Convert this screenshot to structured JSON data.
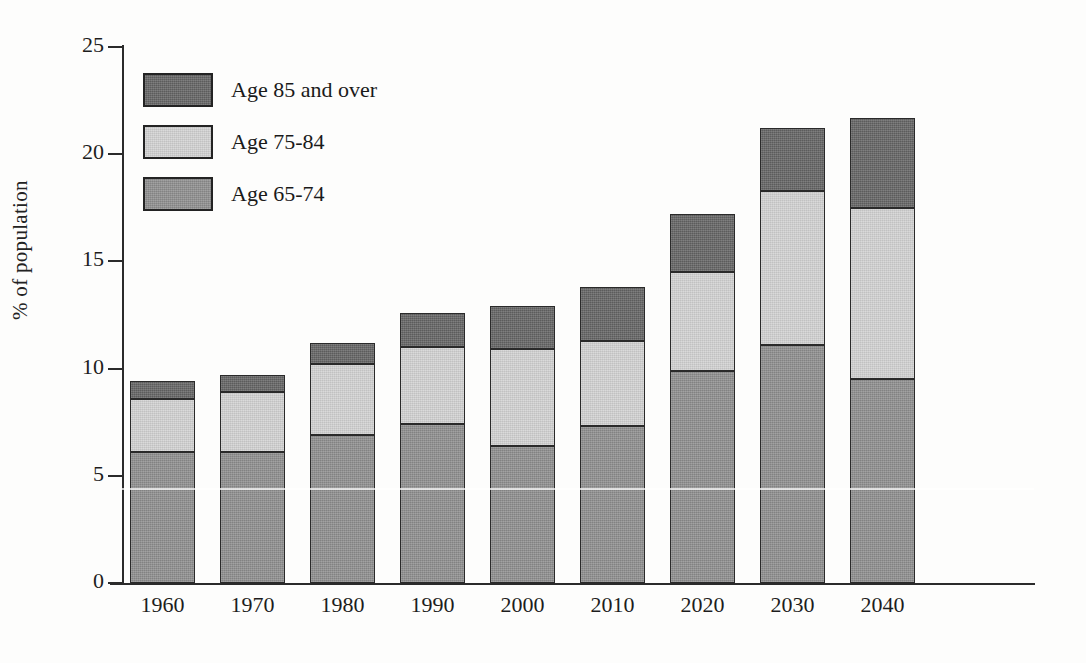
{
  "chart_data": {
    "type": "bar",
    "subtype": "stacked-vertical",
    "title": "",
    "xlabel": "",
    "ylabel": "% of population",
    "ylim": [
      0,
      25
    ],
    "yticks": [
      0,
      5,
      10,
      15,
      20,
      25
    ],
    "ytick_labels": [
      "0",
      "5",
      "10",
      "15",
      "20",
      "25"
    ],
    "grid": false,
    "legend_position": "upper-left-inside",
    "categories": [
      "1960",
      "1970",
      "1980",
      "1990",
      "2000",
      "2010",
      "2020",
      "2030",
      "2040"
    ],
    "series": [
      {
        "name": "Age 65-74",
        "color": "#8e8e8e",
        "values": [
          6.1,
          6.1,
          6.9,
          7.4,
          6.4,
          7.3,
          9.9,
          11.1,
          9.5
        ]
      },
      {
        "name": "Age 75-84",
        "color": "#d2d2d2",
        "values": [
          2.5,
          2.8,
          3.3,
          3.6,
          4.5,
          4.0,
          4.6,
          7.2,
          8.0
        ]
      },
      {
        "name": "Age 85 and over",
        "color": "#646464",
        "values": [
          0.8,
          0.8,
          1.0,
          1.6,
          2.0,
          2.5,
          2.7,
          2.9,
          4.2
        ]
      }
    ],
    "totals": [
      9.4,
      9.7,
      11.2,
      12.6,
      12.9,
      13.8,
      17.2,
      21.2,
      21.7
    ]
  },
  "legend": {
    "items": [
      {
        "label": "Age 85 and over",
        "series_index": 2
      },
      {
        "label": "Age 75-84",
        "series_index": 1
      },
      {
        "label": "Age 65-74",
        "series_index": 0
      }
    ]
  },
  "colors": {
    "age_85_over": "#646464",
    "age_75_84": "#d2d2d2",
    "age_65_74": "#8e8e8e",
    "axis": "#2b2b2b",
    "outline": "#2a2a2a",
    "background": "#fdfdfc"
  }
}
